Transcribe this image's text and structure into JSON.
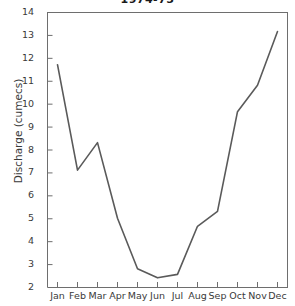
{
  "chart_data": {
    "type": "line",
    "title": "1974-75",
    "xlabel": "",
    "ylabel": "Discharge (cumecs)",
    "categories": [
      "Jan",
      "Feb",
      "Mar",
      "Apr",
      "May",
      "Jun",
      "Jul",
      "Aug",
      "Sep",
      "Oct",
      "Nov",
      "Dec"
    ],
    "values": [
      11.7,
      7.1,
      8.3,
      5.0,
      2.8,
      2.4,
      2.55,
      4.65,
      5.3,
      9.65,
      10.8,
      13.15
    ],
    "series": [
      {
        "name": "Discharge",
        "values": [
          11.7,
          7.1,
          8.3,
          5.0,
          2.8,
          2.4,
          2.55,
          4.65,
          5.3,
          9.65,
          10.8,
          13.15
        ],
        "color": "#5a5a5a"
      }
    ],
    "ylim": [
      2,
      14
    ],
    "ytick_labels": [
      "14",
      "13",
      "12",
      "11",
      "10",
      "9",
      "8",
      "7",
      "6",
      "5",
      "4",
      "3",
      "2"
    ],
    "ytick_values": [
      14,
      13,
      12,
      11,
      10,
      9,
      8,
      7,
      6,
      5,
      4,
      3,
      2
    ],
    "grid": false,
    "legend": "none",
    "axis_color": "#6e6e6e",
    "line_color": "#5a5a5a",
    "background": "#ffffff"
  },
  "axis": {
    "y_label": "Discharge (cumecs)"
  }
}
